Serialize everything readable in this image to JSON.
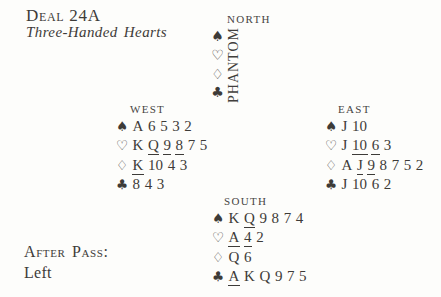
{
  "colors": {
    "ink": "#3d3b38",
    "background": "#fdfdfb"
  },
  "header": {
    "deal_label": "Deal 24A",
    "deal_subtitle": "Three-Handed Hearts"
  },
  "suit_symbols": {
    "spade": "♠",
    "heart": "♡",
    "diamond": "♢",
    "club": "♣"
  },
  "north": {
    "label": "North",
    "phantom_label": "PHANTOM",
    "suit_column": [
      "spade",
      "heart",
      "diamond",
      "club"
    ]
  },
  "seats": {
    "west": {
      "label": "West",
      "lines": [
        {
          "suit": "spade",
          "cards": [
            "A",
            "6",
            "5",
            "3",
            "2"
          ],
          "underlined": []
        },
        {
          "suit": "heart",
          "cards": [
            "K",
            "Q",
            "9",
            "8",
            "7",
            "5"
          ],
          "underlined": [
            "Q",
            "9",
            "8"
          ]
        },
        {
          "suit": "diamond",
          "cards": [
            "K",
            "10",
            "4",
            "3"
          ],
          "underlined": [
            "K"
          ]
        },
        {
          "suit": "club",
          "cards": [
            "8",
            "4",
            "3"
          ],
          "underlined": []
        }
      ]
    },
    "east": {
      "label": "East",
      "lines": [
        {
          "suit": "spade",
          "cards": [
            "J",
            "10"
          ],
          "underlined": []
        },
        {
          "suit": "heart",
          "cards": [
            "J",
            "10",
            "6",
            "3"
          ],
          "underlined": [
            "10",
            "6"
          ]
        },
        {
          "suit": "diamond",
          "cards": [
            "A",
            "J",
            "9",
            "8",
            "7",
            "5",
            "2"
          ],
          "underlined": [
            "J",
            "9"
          ]
        },
        {
          "suit": "club",
          "cards": [
            "J",
            "10",
            "6",
            "2"
          ],
          "underlined": []
        }
      ]
    },
    "south": {
      "label": "South",
      "lines": [
        {
          "suit": "spade",
          "cards": [
            "K",
            "Q",
            "9",
            "8",
            "7",
            "4"
          ],
          "underlined": [
            "Q"
          ]
        },
        {
          "suit": "heart",
          "cards": [
            "A",
            "4",
            "2"
          ],
          "underlined": [
            "A",
            "4"
          ]
        },
        {
          "suit": "diamond",
          "cards": [
            "Q",
            "6"
          ],
          "underlined": []
        },
        {
          "suit": "club",
          "cards": [
            "A",
            "K",
            "Q",
            "9",
            "7",
            "5"
          ],
          "underlined": [
            "A"
          ]
        }
      ]
    }
  },
  "footer": {
    "after_pass_label": "After Pass:",
    "after_pass_value": "Left"
  }
}
